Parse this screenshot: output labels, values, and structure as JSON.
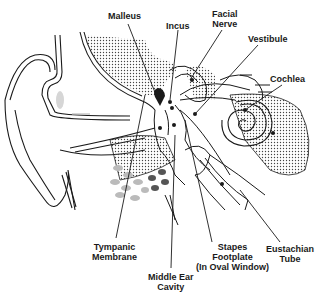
{
  "diagram": {
    "labels": {
      "malleus": "Malleus",
      "incus": "Incus",
      "facial_nerve_1": "Facial",
      "facial_nerve_2": "Nerve",
      "vestibule": "Vestibule",
      "cochlea": "Cochlea",
      "tympanic_1": "Tympanic",
      "tympanic_2": "Membrane",
      "middle_ear_1": "Middle Ear",
      "middle_ear_2": "Cavity",
      "stapes_1": "Stapes",
      "stapes_2": "Footplate",
      "stapes_3": "(In Oval Window)",
      "eustachian_1": "Eustachian",
      "eustachian_2": "Tube"
    },
    "colors": {
      "line": "#1a1a1a",
      "bone_stipple": "#555555",
      "soft_tissue": "#bbbbbb",
      "dark_tissue": "#555555"
    }
  }
}
